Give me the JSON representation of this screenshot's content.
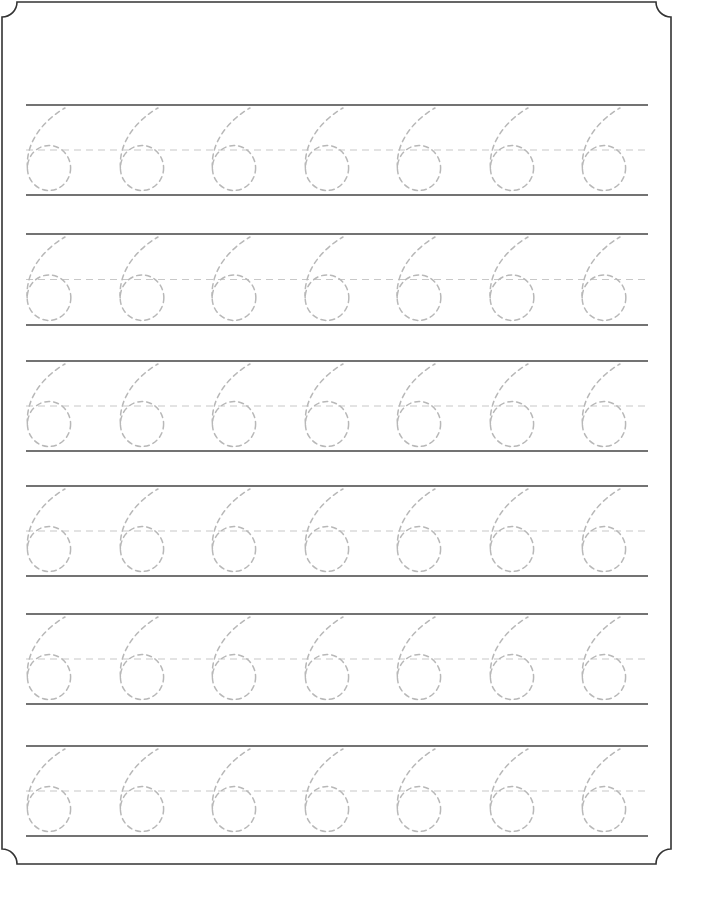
{
  "worksheet": {
    "type": "number tracing practice",
    "digit": "6",
    "rows": 6,
    "digits_per_row": 7,
    "colors": {
      "border": "#333333",
      "ruled_line": "#444444",
      "midline": "#c8c8c8",
      "trace": "#b8b8b8",
      "background": "#ffffff"
    },
    "row_lines": [
      {
        "top": 105,
        "bottom": 195
      },
      {
        "top": 234,
        "bottom": 325
      },
      {
        "top": 361,
        "bottom": 451
      },
      {
        "top": 486,
        "bottom": 576
      },
      {
        "top": 614,
        "bottom": 704
      },
      {
        "top": 746,
        "bottom": 836
      }
    ],
    "digit_x": [
      47,
      140,
      232,
      325,
      417,
      510,
      602
    ]
  }
}
